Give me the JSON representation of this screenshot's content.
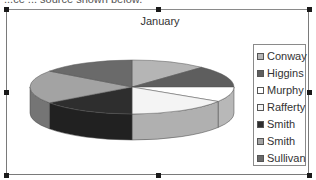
{
  "header": {
    "cut_text": "...ce ... source shown below."
  },
  "chart_data": {
    "type": "pie",
    "style": "3d",
    "title": "January",
    "categories": [
      "Conway",
      "Higgins",
      "Murphy",
      "Rafferty",
      "Smith",
      "Smith",
      "Sullivan"
    ],
    "values": [
      12,
      13,
      9,
      16,
      15,
      20,
      15
    ],
    "legend_position": "right",
    "colors": [
      "#b5b5b5",
      "#5e5e5e",
      "#ffffff",
      "#f4f4f4",
      "#2e2e2e",
      "#a3a3a3",
      "#6a6a6a"
    ]
  },
  "legend": {
    "items": [
      {
        "label": "Conway",
        "color": "#b5b5b5"
      },
      {
        "label": "Higgins",
        "color": "#5e5e5e"
      },
      {
        "label": "Murphy",
        "color": "#ffffff"
      },
      {
        "label": "Rafferty",
        "color": "#f4f4f4"
      },
      {
        "label": "Smith",
        "color": "#2e2e2e"
      },
      {
        "label": "Smith",
        "color": "#a3a3a3"
      },
      {
        "label": "Sullivan",
        "color": "#6a6a6a"
      }
    ]
  }
}
